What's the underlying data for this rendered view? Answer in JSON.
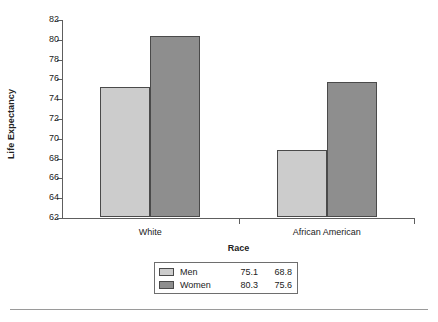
{
  "chart_data": {
    "type": "bar",
    "title": "",
    "xlabel": "Race",
    "ylabel": "Life Expectancy",
    "categories": [
      "White",
      "African American"
    ],
    "series": [
      {
        "name": "Men",
        "color": "#cccccc",
        "values": [
          75.1,
          68.8
        ]
      },
      {
        "name": "Women",
        "color": "#8e8e8e",
        "values": [
          80.3,
          75.6
        ]
      }
    ],
    "ylim": [
      62,
      82
    ],
    "ytick_step": 2,
    "yticks": [
      62,
      64,
      66,
      68,
      70,
      72,
      74,
      76,
      78,
      80,
      82
    ],
    "ytick_labels": [
      "62",
      "64",
      "66",
      "68",
      "70",
      "72",
      "74",
      "76",
      "78",
      "80",
      "82"
    ],
    "grid": false,
    "legend_position": "bottom-center"
  },
  "legend": {
    "rows": [
      {
        "name": "Men",
        "v0": "75.1",
        "v1": "68.8"
      },
      {
        "name": "Women",
        "v0": "80.3",
        "v1": "75.6"
      }
    ]
  }
}
